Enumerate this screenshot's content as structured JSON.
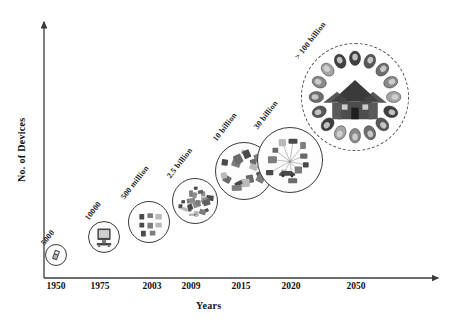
{
  "chart_data": {
    "type": "scatter",
    "title": "",
    "xlabel": "Years",
    "ylabel": "No. of Devices",
    "grid": false,
    "legend": "none",
    "x_ticks": [
      "1950",
      "1975",
      "2003",
      "2009",
      "2015",
      "2020",
      "2050"
    ],
    "categories": [
      "1950",
      "1975",
      "2003",
      "2009",
      "2015",
      "2020",
      "2050"
    ],
    "value_labels": [
      "5000",
      "10000",
      "500 million",
      "2.5 billion",
      "10 billion",
      "30 billion",
      "> 100 billion"
    ],
    "values": [
      5000,
      10000,
      500000000,
      2500000000,
      10000000000,
      30000000000,
      100000000000
    ],
    "points": [
      {
        "year": "1950",
        "label": "5000",
        "value": 5000,
        "cx": 56,
        "cy": 255,
        "r": 11,
        "label_x": 46,
        "label_y": 238,
        "label_rot": -52,
        "icon": "old-mobile-phone-icon",
        "dashed": false
      },
      {
        "year": "1975",
        "label": "10000",
        "value": 10000,
        "cx": 104,
        "cy": 237,
        "r": 16,
        "label_x": 90,
        "label_y": 213,
        "label_rot": -52,
        "icon": "desktop-computer-icon",
        "dashed": false
      },
      {
        "year": "2003",
        "label": "500 million",
        "value": 500000000,
        "cx": 149,
        "cy": 222,
        "r": 21,
        "label_x": 126,
        "label_y": 192,
        "label_rot": -52,
        "icon": "device-grid-icon",
        "dashed": false
      },
      {
        "year": "2009",
        "label": "2.5 billion",
        "value": 2500000000,
        "cx": 195,
        "cy": 201,
        "r": 23,
        "label_x": 172,
        "label_y": 171,
        "label_rot": -52,
        "icon": "electronics-cluster-icon",
        "dashed": false
      },
      {
        "year": "2015",
        "label": "10 billion",
        "value": 10000000000,
        "cx": 244,
        "cy": 171,
        "r": 29,
        "label_x": 218,
        "label_y": 134,
        "label_rot": -52,
        "icon": "connected-gadgets-icon",
        "dashed": false
      },
      {
        "year": "2020",
        "label": "30 billion",
        "value": 30000000000,
        "cx": 290,
        "cy": 160,
        "r": 33,
        "label_x": 259,
        "label_y": 122,
        "label_rot": -52,
        "icon": "iot-network-icon",
        "dashed": false
      },
      {
        "year": "2050",
        "label": "> 100 billion",
        "value": 100000000000,
        "cx": 355,
        "cy": 97,
        "r": 54,
        "label_x": 300,
        "label_y": 52,
        "label_rot": -52,
        "icon": "smart-home-ecosystem-icon",
        "dashed": true
      }
    ],
    "tick_positions": [
      {
        "label": "1950",
        "x": 56
      },
      {
        "label": "1975",
        "x": 100
      },
      {
        "label": "2003",
        "x": 152
      },
      {
        "label": "2009",
        "x": 191
      },
      {
        "label": "2015",
        "x": 241
      },
      {
        "label": "2020",
        "x": 291
      },
      {
        "label": "2050",
        "x": 356
      }
    ]
  },
  "colors": {
    "axis": "#3a3a3a",
    "text": "#111111",
    "node_stroke": "#3a3a3a",
    "dashed_stroke": "#555555",
    "device_dark": "#4a4a4a",
    "device_mid": "#7d7d7d",
    "device_light": "#b9b9b9",
    "background": "#ffffff"
  }
}
